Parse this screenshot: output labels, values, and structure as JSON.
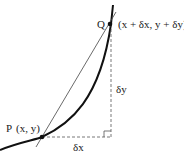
{
  "diagram": {
    "point_q": {
      "label": "Q",
      "coords": "(x + δx, y + δy)"
    },
    "point_p": {
      "label": "P",
      "coords": "(x, y)"
    },
    "delta_x_label": "δx",
    "delta_y_label": "δy",
    "colors": {
      "curve": "#111111",
      "secant": "#333333",
      "dashed": "#555555"
    }
  }
}
